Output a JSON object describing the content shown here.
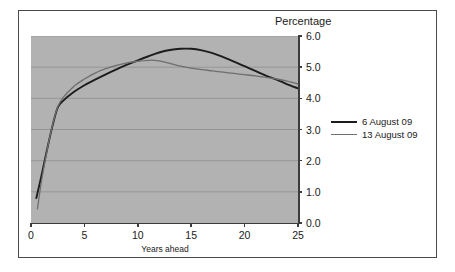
{
  "chart_data": {
    "type": "line",
    "title": "Percentage",
    "xlabel": "Years ahead",
    "ylabel": "",
    "xlim": [
      0,
      25
    ],
    "ylim": [
      0.0,
      6.0
    ],
    "xticks": [
      "0",
      "5",
      "10",
      "15",
      "20",
      "25"
    ],
    "xtick_values": [
      0,
      5,
      10,
      15,
      20,
      25
    ],
    "yticks": [
      "0.0",
      "1.0",
      "2.0",
      "3.0",
      "4.0",
      "5.0",
      "6.0"
    ],
    "ytick_values": [
      0.0,
      1.0,
      2.0,
      3.0,
      4.0,
      5.0,
      6.0
    ],
    "grid": true,
    "grid_axis": "y",
    "legend_position": "right",
    "plot_background": "#b2b2b2",
    "series": [
      {
        "name": "6 August 09",
        "color": "#1c1c1c",
        "width": 1.9,
        "x": [
          0.5,
          1.0,
          1.5,
          2.0,
          2.5,
          3.0,
          4.0,
          5.0,
          6.0,
          7.0,
          8.0,
          9.0,
          10.0,
          11.0,
          12.0,
          13.0,
          14.0,
          15.0,
          16.0,
          17.0,
          18.0,
          19.0,
          20.0,
          21.0,
          22.0,
          23.0,
          24.0,
          25.0
        ],
        "values": [
          0.8,
          1.55,
          2.35,
          3.1,
          3.7,
          3.92,
          4.2,
          4.42,
          4.6,
          4.77,
          4.93,
          5.08,
          5.22,
          5.35,
          5.47,
          5.55,
          5.59,
          5.59,
          5.54,
          5.45,
          5.32,
          5.18,
          5.03,
          4.88,
          4.73,
          4.6,
          4.45,
          4.32
        ]
      },
      {
        "name": "13 August 09",
        "color": "#6e6e6e",
        "width": 1.3,
        "x": [
          0.6,
          1.0,
          1.5,
          2.0,
          2.5,
          3.0,
          4.0,
          5.0,
          6.0,
          7.0,
          8.0,
          9.0,
          10.0,
          11.0,
          11.6,
          12.0,
          13.0,
          14.0,
          15.0,
          16.0,
          17.0,
          18.0,
          19.0,
          20.0,
          21.0,
          22.0,
          23.0,
          24.0,
          25.0
        ],
        "values": [
          0.45,
          1.38,
          2.32,
          3.12,
          3.72,
          4.02,
          4.38,
          4.62,
          4.81,
          4.95,
          5.06,
          5.14,
          5.19,
          5.22,
          5.22,
          5.2,
          5.12,
          5.03,
          4.97,
          4.92,
          4.88,
          4.84,
          4.8,
          4.76,
          4.72,
          4.67,
          4.62,
          4.55,
          4.46
        ]
      }
    ]
  },
  "legend": {
    "items": [
      {
        "label": "6 August 09",
        "color": "#1c1c1c",
        "thickness": 2
      },
      {
        "label": "13 August 09",
        "color": "#6e6e6e",
        "thickness": 1
      }
    ]
  }
}
